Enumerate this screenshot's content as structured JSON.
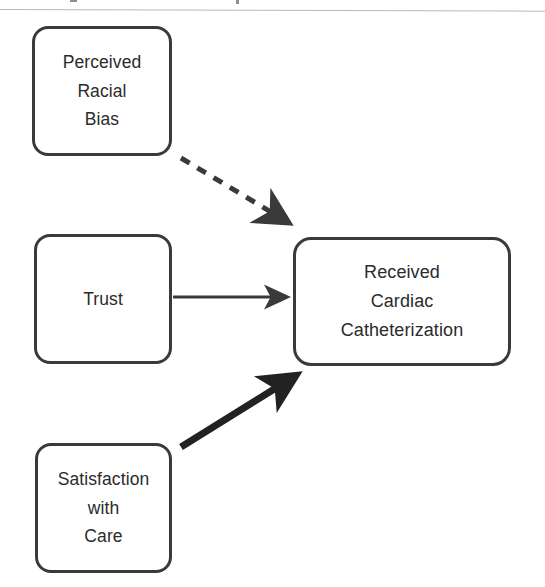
{
  "figure": {
    "type": "path-diagram",
    "background_color": "#ffffff",
    "stroke_color": "#3a3a3a",
    "text_color": "#2b2b2b"
  },
  "artifacts": {
    "scan_rule_label": "",
    "speck_a_label": "",
    "speck_b_label": ""
  },
  "nodes": [
    {
      "id": "perceived-racial-bias",
      "lines": [
        "Perceived",
        "Racial",
        "Bias"
      ],
      "line1": "Perceived",
      "line2": "Racial",
      "line3": "Bias",
      "x": 32,
      "y": 26,
      "width": 140,
      "height": 130
    },
    {
      "id": "trust",
      "lines": [
        "Trust"
      ],
      "line1": "Trust",
      "x": 34,
      "y": 234,
      "width": 138,
      "height": 130
    },
    {
      "id": "satisfaction-with-care",
      "lines": [
        "Satisfaction",
        "with",
        "Care"
      ],
      "line1": "Satisfaction",
      "line2": "with",
      "line3": "Care",
      "x": 35,
      "y": 443,
      "width": 137,
      "height": 130
    },
    {
      "id": "received-cardiac-catheterization",
      "lines": [
        "Received",
        "Cardiac",
        "Catheterization"
      ],
      "line1": "Received",
      "line2": "Cardiac",
      "line3": "Catheterization",
      "x": 293,
      "y": 237,
      "width": 218,
      "height": 129
    }
  ],
  "edges": [
    {
      "id": "edge-bias-to-outcome",
      "from": "perceived-racial-bias",
      "to": "received-cardiac-catheterization",
      "style": "dashed",
      "weight": "medium",
      "stroke_width": 5,
      "dash_pattern": "10 9",
      "color": "#3a3a3a",
      "x1": 181,
      "y1": 158,
      "x2": 292,
      "y2": 225,
      "label": ""
    },
    {
      "id": "edge-trust-to-outcome",
      "from": "trust",
      "to": "received-cardiac-catheterization",
      "style": "solid",
      "weight": "thin",
      "stroke_width": 3,
      "color": "#3a3a3a",
      "x1": 173,
      "y1": 297,
      "x2": 291,
      "y2": 297,
      "label": ""
    },
    {
      "id": "edge-satisfaction-to-outcome",
      "from": "satisfaction-with-care",
      "to": "received-cardiac-catheterization",
      "style": "solid",
      "weight": "thick",
      "stroke_width": 7,
      "color": "#222222",
      "x1": 181,
      "y1": 447,
      "x2": 299,
      "y2": 373,
      "label": ""
    }
  ]
}
